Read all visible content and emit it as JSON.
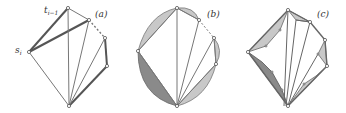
{
  "figure": {
    "panels": [
      {
        "id": "a",
        "label": "(a)"
      },
      {
        "id": "b",
        "label": "(b)"
      },
      {
        "id": "c",
        "label": "(c)"
      }
    ],
    "vertex_labels": {
      "s_i": "s",
      "s_i_sub": "i",
      "t_prev": "t",
      "t_prev_sub": "i−1"
    },
    "colors": {
      "edge": "#777777",
      "edge_bold": "#555555",
      "light_fill": "#c8c8c8",
      "dark_fill": "#8a8a8a",
      "vertex_fill": "#ffffff"
    }
  }
}
